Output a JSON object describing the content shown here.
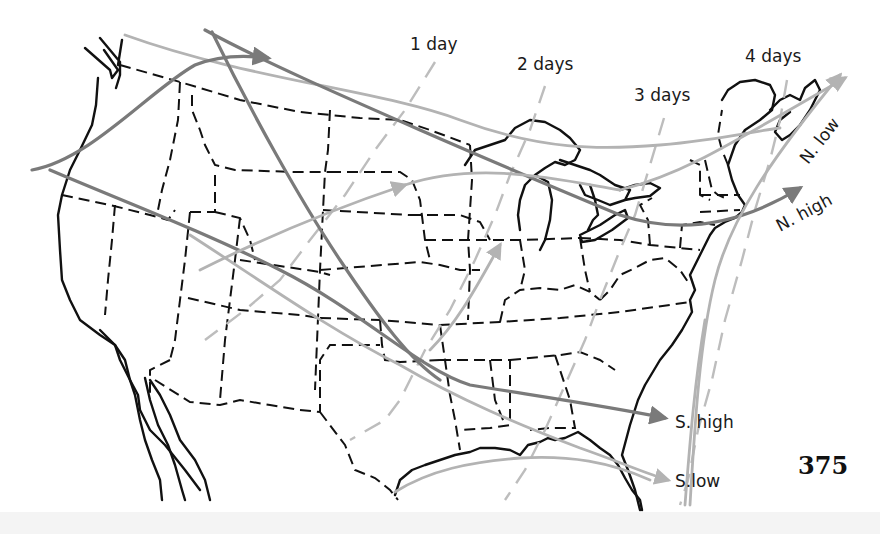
{
  "figure": {
    "type": "storm-track-map",
    "region": "United States",
    "page_number": "375"
  },
  "isochrones": [
    {
      "label": "1 day"
    },
    {
      "label": "2 days"
    },
    {
      "label": "3 days"
    },
    {
      "label": "4 days"
    }
  ],
  "tracks": [
    {
      "label": "N. low",
      "kind": "low"
    },
    {
      "label": "N. high",
      "kind": "high"
    },
    {
      "label": "S. high",
      "kind": "high"
    },
    {
      "label": "S.low",
      "kind": "low"
    }
  ],
  "colors": {
    "coastline": "#111111",
    "state_border": "#111111",
    "high_track": "#7a7a7a",
    "low_track": "#b3b3b3",
    "isochrone": "#bdbdbd",
    "background": "#ffffff"
  }
}
